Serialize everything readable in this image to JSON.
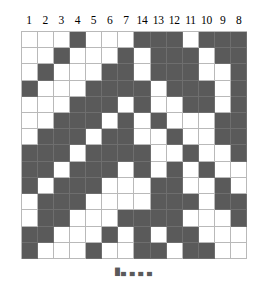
{
  "figure": {
    "type": "binary-grid-diagram",
    "rows": 14,
    "columns": 14,
    "fill_color": "#5a5a5a",
    "empty_color": "#ffffff",
    "gridline_color": "#b9b9b9"
  },
  "column_headers": [
    "1",
    "2",
    "3",
    "4",
    "5",
    "6",
    "7",
    "14",
    "13",
    "12",
    "11",
    "10",
    "9",
    "8"
  ],
  "caption": "█▄ ▄ ▄ ▄",
  "grid_rows": [
    [
      0,
      0,
      0,
      1,
      0,
      0,
      0,
      1,
      1,
      1,
      0,
      1,
      1,
      1
    ],
    [
      0,
      0,
      1,
      0,
      0,
      0,
      1,
      0,
      1,
      1,
      1,
      0,
      1,
      1
    ],
    [
      0,
      1,
      0,
      0,
      0,
      1,
      1,
      0,
      1,
      1,
      1,
      0,
      0,
      1
    ],
    [
      1,
      0,
      0,
      0,
      1,
      1,
      1,
      1,
      0,
      1,
      1,
      1,
      0,
      1
    ],
    [
      0,
      0,
      0,
      1,
      1,
      1,
      0,
      1,
      0,
      0,
      1,
      1,
      0,
      1
    ],
    [
      0,
      0,
      1,
      1,
      1,
      0,
      1,
      0,
      1,
      0,
      0,
      0,
      1,
      1
    ],
    [
      0,
      1,
      1,
      1,
      0,
      1,
      1,
      0,
      0,
      1,
      0,
      0,
      1,
      1
    ],
    [
      1,
      1,
      1,
      0,
      1,
      1,
      1,
      1,
      0,
      0,
      1,
      0,
      0,
      1
    ],
    [
      1,
      1,
      0,
      1,
      1,
      1,
      0,
      1,
      0,
      1,
      0,
      1,
      0,
      0
    ],
    [
      1,
      0,
      1,
      1,
      1,
      0,
      0,
      0,
      1,
      1,
      0,
      0,
      1,
      0
    ],
    [
      0,
      1,
      1,
      1,
      0,
      0,
      0,
      0,
      1,
      1,
      1,
      0,
      1,
      1
    ],
    [
      0,
      1,
      1,
      0,
      0,
      0,
      1,
      1,
      1,
      1,
      0,
      0,
      0,
      1
    ],
    [
      1,
      1,
      0,
      0,
      0,
      1,
      0,
      1,
      0,
      1,
      1,
      0,
      0,
      0
    ],
    [
      1,
      0,
      0,
      0,
      1,
      0,
      0,
      1,
      1,
      0,
      1,
      1,
      0,
      0
    ]
  ]
}
